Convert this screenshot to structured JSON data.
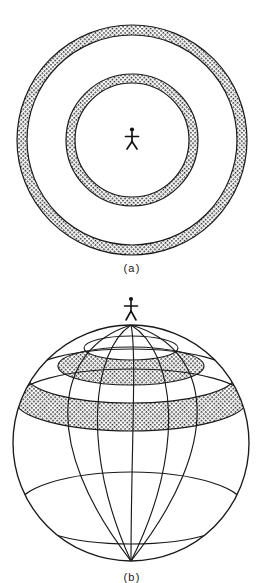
{
  "figure": {
    "background_color": "#ffffff",
    "ink_color": "#1a1a1a",
    "stipple_color": "#2b2b2b",
    "width": 264,
    "height": 583,
    "panels": [
      {
        "id": "a",
        "caption": "(a)",
        "type": "concentric-rings-plan-view",
        "description": "Plan view: observer at centre surrounded by two concentric stippled annular zones",
        "center": {
          "x": 132,
          "y": 140
        },
        "rings": [
          {
            "name": "outer-ring",
            "inner_radius": 105,
            "outer_radius": 115,
            "fill": "stipple"
          },
          {
            "name": "inner-ring",
            "inner_radius": 57,
            "outer_radius": 66,
            "fill": "stipple"
          }
        ],
        "observer": {
          "name": "stick-figure",
          "x": 132,
          "y": 137,
          "height": 20
        }
      },
      {
        "id": "b",
        "caption": "(b)",
        "type": "globe-wireframe-with-latitude-bands",
        "description": "Perspective globe with meridians converging at the poles, latitude circles, and two stippled latitude bands; observer stands at the north pole",
        "center": {
          "x": 131,
          "y": 443
        },
        "radius": 118,
        "meridian_count": 5,
        "latitude_lines": 4,
        "bands": [
          {
            "name": "upper-narrow-band",
            "latitude_top_deg": 68,
            "latitude_bottom_deg": 58,
            "fill": "stipple"
          },
          {
            "name": "lower-wide-band",
            "latitude_top_deg": 32,
            "latitude_bottom_deg": 17,
            "fill": "stipple"
          }
        ],
        "observer": {
          "name": "stick-figure",
          "x": 131,
          "y": 306,
          "height": 20
        }
      }
    ]
  }
}
